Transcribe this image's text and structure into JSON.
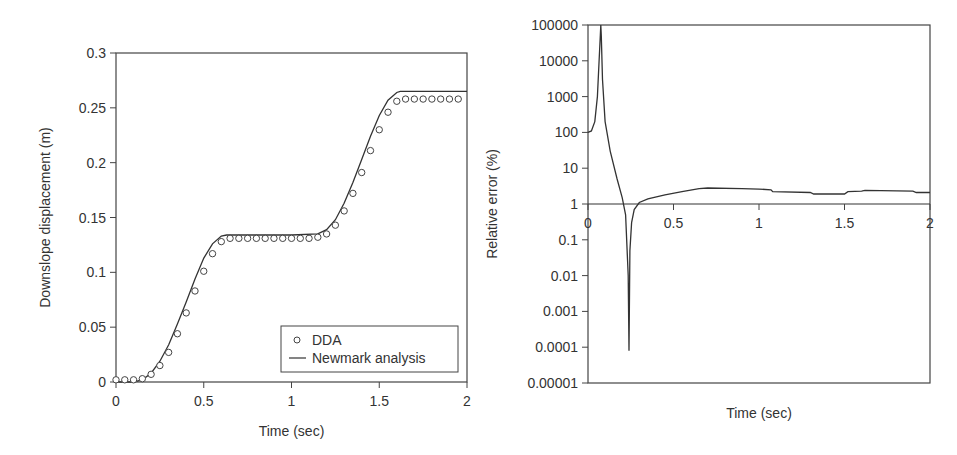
{
  "chart_data": [
    {
      "type": "line",
      "title": "",
      "xlabel": "Time (sec)",
      "ylabel": "Downslope displacement (m)",
      "xlim": [
        0,
        2
      ],
      "ylim": [
        0,
        0.3
      ],
      "xticks": [
        "0",
        "0.5",
        "1",
        "1.5",
        "2"
      ],
      "yticks": [
        "0",
        "0.05",
        "0.1",
        "0.15",
        "0.2",
        "0.25",
        "0.3"
      ],
      "grid": false,
      "legend": {
        "position": "lower right",
        "entries": [
          {
            "label": "DDA",
            "marker": "circle"
          },
          {
            "label": "Newmark analysis",
            "marker": "line"
          }
        ]
      },
      "series": [
        {
          "name": "DDA",
          "style": "open-circle",
          "x": [
            0,
            0.05,
            0.1,
            0.15,
            0.2,
            0.25,
            0.3,
            0.35,
            0.4,
            0.45,
            0.5,
            0.55,
            0.6,
            0.65,
            0.7,
            0.75,
            0.8,
            0.85,
            0.9,
            0.95,
            1.0,
            1.05,
            1.1,
            1.15,
            1.2,
            1.25,
            1.3,
            1.35,
            1.4,
            1.45,
            1.5,
            1.55,
            1.6,
            1.65,
            1.7,
            1.75,
            1.8,
            1.85,
            1.9,
            1.95
          ],
          "y": [
            0.002,
            0.002,
            0.002,
            0.003,
            0.007,
            0.015,
            0.027,
            0.044,
            0.063,
            0.083,
            0.101,
            0.117,
            0.128,
            0.131,
            0.131,
            0.131,
            0.131,
            0.131,
            0.131,
            0.131,
            0.131,
            0.131,
            0.131,
            0.132,
            0.135,
            0.143,
            0.156,
            0.172,
            0.191,
            0.211,
            0.23,
            0.246,
            0.256,
            0.258,
            0.258,
            0.258,
            0.258,
            0.258,
            0.258,
            0.258
          ]
        },
        {
          "name": "Newmark analysis",
          "style": "solid-line",
          "x": [
            0,
            0.1,
            0.15,
            0.2,
            0.25,
            0.3,
            0.35,
            0.4,
            0.45,
            0.5,
            0.55,
            0.6,
            0.63,
            1.0,
            1.15,
            1.2,
            1.25,
            1.3,
            1.35,
            1.4,
            1.45,
            1.5,
            1.55,
            1.6,
            1.62,
            2.0
          ],
          "y": [
            0,
            0,
            0.002,
            0.008,
            0.019,
            0.034,
            0.053,
            0.073,
            0.094,
            0.113,
            0.126,
            0.133,
            0.134,
            0.134,
            0.135,
            0.139,
            0.148,
            0.163,
            0.182,
            0.203,
            0.224,
            0.243,
            0.257,
            0.264,
            0.265,
            0.265
          ]
        }
      ]
    },
    {
      "type": "line",
      "title": "",
      "xlabel": "Time (sec)",
      "ylabel": "Relative error (%)",
      "xlim": [
        0,
        2
      ],
      "ylim": [
        1e-05,
        100000
      ],
      "yscale": "log",
      "xticks": [
        "0",
        "0.5",
        "1",
        "1.5",
        "2"
      ],
      "yticks": [
        "0.00001",
        "0.0001",
        "0.001",
        "0.01",
        "0.1",
        "1",
        "10",
        "100",
        "1000",
        "10000",
        "100000"
      ],
      "grid": false,
      "reference_line": {
        "y": 1,
        "label": "1%"
      },
      "series": [
        {
          "name": "Relative error",
          "style": "solid-line",
          "x": [
            0,
            0.02,
            0.04,
            0.055,
            0.065,
            0.072,
            0.075,
            0.078,
            0.085,
            0.1,
            0.13,
            0.17,
            0.2,
            0.22,
            0.235,
            0.24,
            0.245,
            0.255,
            0.27,
            0.3,
            0.35,
            0.45,
            0.55,
            0.65,
            0.7,
            0.9,
            1.0,
            1.07,
            1.08,
            1.3,
            1.32,
            1.5,
            1.52,
            1.6,
            1.62,
            1.9,
            1.92,
            2.0
          ],
          "y": [
            100,
            110,
            200,
            1000,
            10000,
            50000,
            100000,
            50000,
            3000,
            200,
            30,
            5,
            1.5,
            0.5,
            0.01,
            8e-05,
            0.05,
            0.3,
            0.7,
            1.1,
            1.4,
            1.8,
            2.2,
            2.7,
            2.8,
            2.7,
            2.6,
            2.5,
            2.2,
            2.1,
            1.9,
            1.9,
            2.2,
            2.3,
            2.4,
            2.3,
            2.1,
            2.1
          ]
        }
      ]
    }
  ]
}
